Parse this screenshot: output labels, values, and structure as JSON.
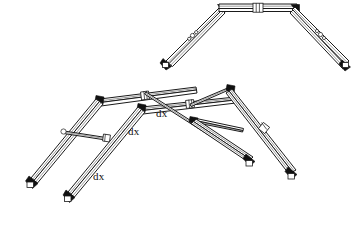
{
  "diagram": {
    "background_color": "#ffffff",
    "line_color": "#1a1a1a",
    "cap_color": "#111111",
    "structures": [
      {
        "name": "upper-frame",
        "description": "Symmetric arched tubular frame, front elevation view",
        "segments": 5,
        "joint_count": 2,
        "feet": 2
      },
      {
        "name": "lower-frame",
        "description": "Perspective view of tubular frame with cross braces",
        "segments": 9,
        "joint_count": 6,
        "feet": 4
      }
    ],
    "labels": [
      {
        "id": "dx-1",
        "text": "dx",
        "x": 156,
        "y": 108
      },
      {
        "id": "dx-2",
        "text": "dx",
        "x": 128,
        "y": 126
      },
      {
        "id": "dx-3",
        "text": "dx",
        "x": 93,
        "y": 171
      }
    ]
  }
}
